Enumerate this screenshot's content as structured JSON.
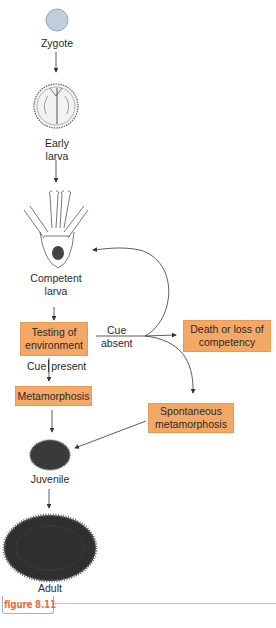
{
  "figure": {
    "label": "figure 8.11",
    "accent_color": "#e8703a",
    "box_color": "#f4a866"
  },
  "stages": {
    "zygote": "Zygote",
    "early_larva_1": "Early",
    "early_larva_2": "larva",
    "competent_larva_1": "Competent",
    "competent_larva_2": "larva",
    "juvenile": "Juvenile",
    "adult": "Adult"
  },
  "boxes": {
    "testing_1": "Testing of",
    "testing_2": "environment",
    "metamorphosis": "Metamorphosis",
    "death_1": "Death or loss of",
    "death_2": "competency",
    "spontaneous_1": "Spontaneous",
    "spontaneous_2": "metamorphosis"
  },
  "edge_labels": {
    "cue_absent_1": "Cue",
    "cue_absent_2": "absent",
    "cue_present_1": "Cue",
    "cue_present_2": "present"
  }
}
